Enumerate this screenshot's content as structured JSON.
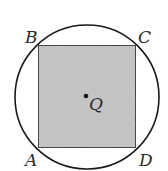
{
  "diagram": {
    "type": "square-inscribed-in-circle",
    "circle": {
      "cx": 87,
      "cy": 97,
      "r": 72,
      "stroke": "#1a1a1a"
    },
    "square": {
      "x": 38,
      "y": 45,
      "width": 98,
      "height": 103,
      "fill": "#c4c4c4",
      "stroke": "#1a1a1a"
    },
    "center_point": {
      "x": 86,
      "y": 96,
      "label": "Q"
    },
    "vertices": [
      {
        "label": "B",
        "x": 38,
        "y": 45
      },
      {
        "label": "C",
        "x": 136,
        "y": 45
      },
      {
        "label": "D",
        "x": 136,
        "y": 148
      },
      {
        "label": "A",
        "x": 38,
        "y": 148
      }
    ]
  }
}
